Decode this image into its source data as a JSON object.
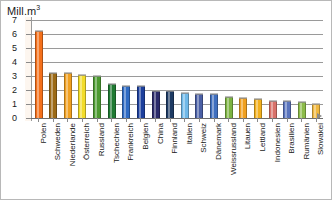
{
  "chart_data": {
    "type": "bar",
    "title": "",
    "ylabel": "Mill.m³",
    "xlabel": "",
    "ylim": [
      0,
      7
    ],
    "yticks": [
      7,
      6,
      5,
      4,
      3,
      2,
      1,
      0
    ],
    "grid": true,
    "legend": "none",
    "categories": [
      "Polen",
      "Schweden",
      "Niederlande",
      "Österreich",
      "Russland",
      "Tschechien",
      "Frankreich",
      "Belgien",
      "China",
      "Finnland",
      "Italien",
      "Schweiz",
      "Dänemark",
      "Weissrussland",
      "Litauen",
      "Lettland",
      "Indonesien",
      "Brasilien",
      "Rumänien",
      "Slowakei"
    ],
    "values": [
      6.2,
      3.25,
      3.2,
      3.05,
      3.0,
      2.45,
      2.3,
      2.3,
      1.95,
      1.95,
      1.8,
      1.75,
      1.7,
      1.5,
      1.45,
      1.35,
      1.25,
      1.2,
      1.15,
      1.0
    ],
    "colors": [
      "#f4701b",
      "#9c6a16",
      "#f0a021",
      "#f2dc2a",
      "#4d9b31",
      "#1f7a32",
      "#2f6bc4",
      "#1c3f9c",
      "#2b2a6b",
      "#1d3a63",
      "#6fb8e8",
      "#4a5fa5",
      "#3f6fbf",
      "#7cb342",
      "#f0a021",
      "#f2b01e",
      "#d9726a",
      "#5a74bd",
      "#8cbb4a",
      "#f0b840"
    ]
  },
  "axis": {
    "y_title_main": "Mill.m",
    "y_title_sup": "3"
  }
}
